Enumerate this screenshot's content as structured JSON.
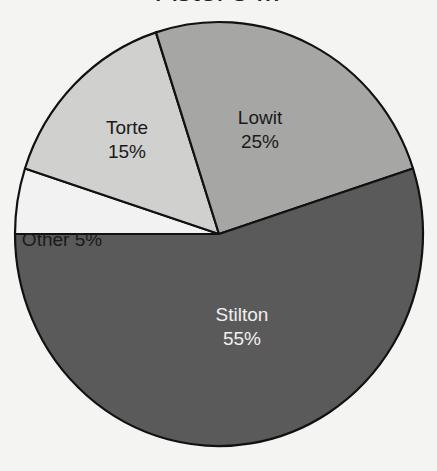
{
  "chart_data": {
    "type": "pie",
    "title": "Aster's ...",
    "start_angle_deg": 180,
    "direction": "clockwise",
    "slices": [
      {
        "label": "Other",
        "value": 5,
        "value_label": "5%",
        "color": "#f2f2f2",
        "text_color": "#1a1a1a",
        "inline_label": true
      },
      {
        "label": "Torte",
        "value": 15,
        "value_label": "15%",
        "color": "#d0d0cf",
        "text_color": "#1a1a1a",
        "inline_label": false
      },
      {
        "label": "Lowit",
        "value": 25,
        "value_label": "25%",
        "color": "#a6a6a5",
        "text_color": "#1a1a1a",
        "inline_label": false
      },
      {
        "label": "Stilton",
        "value": 55,
        "value_label": "55%",
        "color": "#5a5a5a",
        "text_color": "#f0f0f0",
        "inline_label": false
      }
    ],
    "legend": "none",
    "units": "percent"
  }
}
